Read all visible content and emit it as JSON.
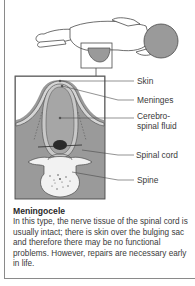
{
  "figure": {
    "labels": {
      "skin": "Skin",
      "meninges": "Meninges",
      "csf_line1": "Cerebro-",
      "csf_line2": "spinal fluid",
      "spinal_cord": "Spinal cord",
      "spine": "Spine"
    },
    "colors": {
      "line": "#4a4a4a",
      "fill_dark": "#9a9a9a",
      "fill_mid": "#b5b5b5",
      "fill_light": "#d6d6d6",
      "paper": "#ffffff"
    }
  },
  "caption": {
    "title": "Meningocele",
    "body": "In this type, the nerve tissue of the spinal cord is usually intact; there is skin over the bulging sac and therefore there may be no functional problems. However, repairs are necessary early in life."
  }
}
